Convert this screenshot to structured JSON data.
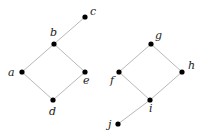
{
  "diagram": {
    "type": "hasse-diagrams",
    "colors": {
      "edge": "#b8b8b8",
      "node": "#000000",
      "label": "#222222",
      "background": "#ffffff"
    },
    "posets": [
      {
        "name": "left",
        "nodes": [
          {
            "id": "a",
            "label": "a",
            "x": 22,
            "y": 72,
            "lx": 8,
            "ly": 76
          },
          {
            "id": "b",
            "label": "b",
            "x": 54,
            "y": 44,
            "lx": 50,
            "ly": 36
          },
          {
            "id": "c",
            "label": "c",
            "x": 85,
            "y": 17,
            "lx": 90,
            "ly": 15
          },
          {
            "id": "d",
            "label": "d",
            "x": 53,
            "y": 100,
            "lx": 49,
            "ly": 115
          },
          {
            "id": "e",
            "label": "e",
            "x": 85,
            "y": 72,
            "lx": 83,
            "ly": 84
          }
        ],
        "edges": [
          [
            "a",
            "b"
          ],
          [
            "b",
            "c"
          ],
          [
            "a",
            "d"
          ],
          [
            "d",
            "e"
          ],
          [
            "e",
            "b"
          ]
        ]
      },
      {
        "name": "right",
        "nodes": [
          {
            "id": "f",
            "label": "f",
            "x": 119,
            "y": 72,
            "lx": 110,
            "ly": 84
          },
          {
            "id": "g",
            "label": "g",
            "x": 151,
            "y": 44,
            "lx": 155,
            "ly": 39
          },
          {
            "id": "h",
            "label": "h",
            "x": 182,
            "y": 72,
            "lx": 188,
            "ly": 69
          },
          {
            "id": "i",
            "label": "i",
            "x": 150,
            "y": 100,
            "lx": 149,
            "ly": 112
          },
          {
            "id": "j",
            "label": "j",
            "x": 118,
            "y": 124,
            "lx": 108,
            "ly": 128
          }
        ],
        "edges": [
          [
            "f",
            "g"
          ],
          [
            "g",
            "h"
          ],
          [
            "h",
            "i"
          ],
          [
            "i",
            "f"
          ],
          [
            "i",
            "j"
          ]
        ]
      }
    ]
  }
}
